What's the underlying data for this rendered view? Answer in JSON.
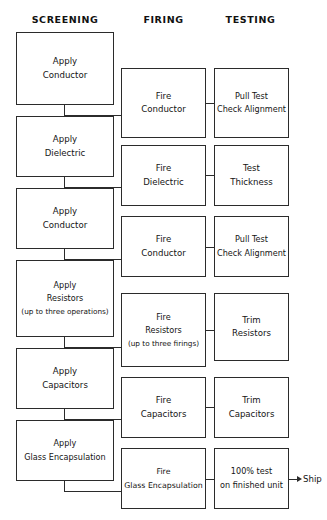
{
  "diagram": {
    "title_columns": [
      {
        "key": "screening",
        "label": "SCREENING"
      },
      {
        "key": "firing",
        "label": "FIRING"
      },
      {
        "key": "testing",
        "label": "TESTING"
      }
    ],
    "ship": {
      "label": "Ship",
      "arrow_icon": "arrow-right-icon"
    },
    "colors": {
      "line": "#2b2b2b",
      "text": "#141414",
      "background": "#ffffff"
    }
  },
  "screening": {
    "nodes": [
      {
        "line1": "Apply",
        "line2": "Conductor",
        "line3": ""
      },
      {
        "line1": "Apply",
        "line2": "Dielectric",
        "line3": ""
      },
      {
        "line1": "Apply",
        "line2": "Conductor",
        "line3": ""
      },
      {
        "line1": "Apply",
        "line2": "Resistors",
        "line3": "(up to three operations)"
      },
      {
        "line1": "Apply",
        "line2": "Capacitors",
        "line3": ""
      },
      {
        "line1": "Apply",
        "line2": "Glass Encapsulation",
        "line3": ""
      }
    ]
  },
  "firing": {
    "nodes": [
      {
        "line1": "Fire",
        "line2": "Conductor",
        "line3": ""
      },
      {
        "line1": "Fire",
        "line2": "Dielectric",
        "line3": ""
      },
      {
        "line1": "Fire",
        "line2": "Conductor",
        "line3": ""
      },
      {
        "line1": "Fire",
        "line2": "Resistors",
        "line3": "(up to three firings)"
      },
      {
        "line1": "Fire",
        "line2": "Capacitors",
        "line3": ""
      },
      {
        "line1": "Fire",
        "line2": "Glass Encapsulation",
        "line3": ""
      }
    ]
  },
  "testing": {
    "nodes": [
      {
        "line1": "Pull Test",
        "line2": "Check Alignment",
        "line3": ""
      },
      {
        "line1": "Test",
        "line2": "Thickness",
        "line3": ""
      },
      {
        "line1": "Pull Test",
        "line2": "Check Alignment",
        "line3": ""
      },
      {
        "line1": "Trim",
        "line2": "Resistors",
        "line3": ""
      },
      {
        "line1": "Trim",
        "line2": "Capacitors",
        "line3": ""
      },
      {
        "line1": "100% test",
        "line2": "on finished unit",
        "line3": ""
      }
    ]
  }
}
